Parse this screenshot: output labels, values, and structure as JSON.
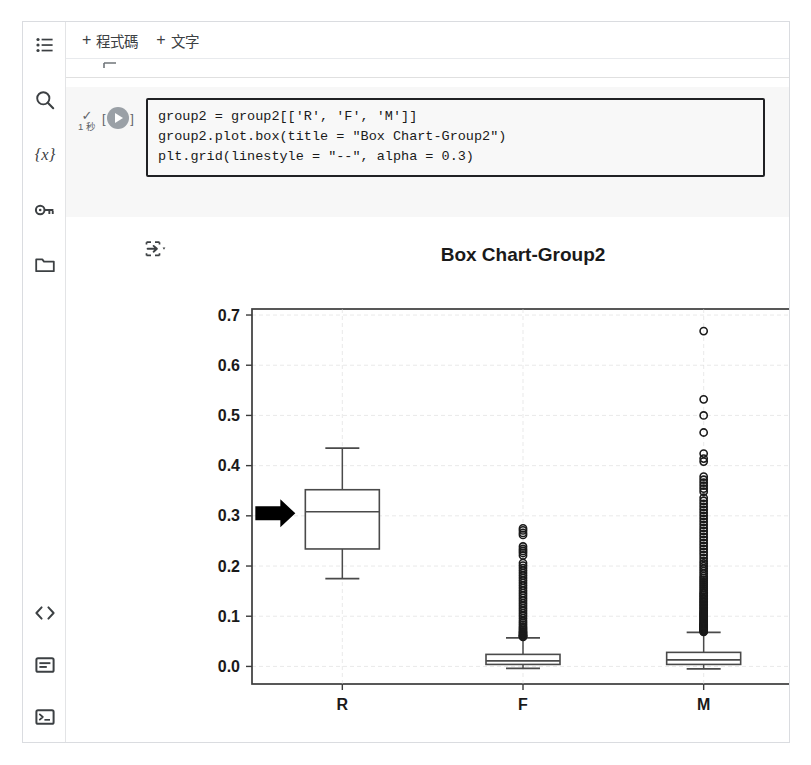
{
  "app": {
    "toolbar": {
      "add_code_label": "程式碼",
      "add_text_label": "文字",
      "plus": "+"
    },
    "sidebar": {
      "top_items": [
        {
          "name": "table-of-contents-icon",
          "label": "目錄"
        },
        {
          "name": "search-icon",
          "label": "搜尋"
        },
        {
          "name": "variables-icon",
          "label": "{x}"
        },
        {
          "name": "secrets-key-icon",
          "label": "密鑰"
        },
        {
          "name": "files-folder-icon",
          "label": "檔案"
        }
      ],
      "bottom_items": [
        {
          "name": "code-snippets-icon",
          "label": "< >"
        },
        {
          "name": "command-palette-icon",
          "label": "指令"
        },
        {
          "name": "terminal-icon",
          "label": "終端機"
        }
      ]
    },
    "cell": {
      "status_check": "✓",
      "run_time": "1 秒",
      "bracket_left": "[",
      "bracket_right": "]",
      "code_lines": [
        "group2 = group2[['R', 'F', 'M']]",
        "group2.plot.box(title = \"Box Chart-Group2\")",
        "plt.grid(linestyle = \"--\", alpha = 0.3)"
      ]
    },
    "colors": {
      "cell_background": "#f7f7f7",
      "editor_border": "#202124",
      "run_button": "#9aa0a6",
      "rail_icon": "#3c4043",
      "annotation_arrow": "#000000",
      "grid": "#d9d9d9",
      "axis": "#3b3b3b"
    }
  },
  "chart_data": {
    "type": "box",
    "title": "Box Chart-Group2",
    "xlabel": "",
    "ylabel": "",
    "categories": [
      "R",
      "F",
      "M"
    ],
    "ylim": [
      -0.035,
      0.712
    ],
    "yticks": [
      0.0,
      0.1,
      0.2,
      0.3,
      0.4,
      0.5,
      0.6,
      0.7
    ],
    "ytick_labels": [
      "0.0",
      "0.1",
      "0.2",
      "0.3",
      "0.4",
      "0.5",
      "0.6",
      "0.7"
    ],
    "grid": true,
    "grid_linestyle": "--",
    "grid_alpha": 0.3,
    "legend": "none",
    "boxes": [
      {
        "category": "R",
        "whisker_low": 0.175,
        "q1": 0.234,
        "median": 0.308,
        "q3": 0.352,
        "whisker_high": 0.435,
        "outliers": []
      },
      {
        "category": "F",
        "whisker_low": -0.004,
        "q1": 0.004,
        "median": 0.011,
        "q3": 0.024,
        "whisker_high": 0.057,
        "outliers": [
          0.275,
          0.271,
          0.266,
          0.262,
          0.239,
          0.234,
          0.23,
          0.226,
          0.221,
          0.206,
          0.201,
          0.196,
          0.191,
          0.186,
          0.181,
          0.176,
          0.171,
          0.166,
          0.161,
          0.156,
          0.151,
          0.146,
          0.141,
          0.136,
          0.131,
          0.126,
          0.121,
          0.116,
          0.111,
          0.106,
          0.101,
          0.096,
          0.091,
          0.087,
          0.083,
          0.079,
          0.076,
          0.073,
          0.07,
          0.068,
          0.066,
          0.064,
          0.062,
          0.061,
          0.06,
          0.059
        ]
      },
      {
        "category": "M",
        "whisker_low": -0.005,
        "q1": 0.004,
        "median": 0.013,
        "q3": 0.028,
        "whisker_high": 0.068,
        "outliers": [
          0.668,
          0.532,
          0.5,
          0.466,
          0.424,
          0.414,
          0.408,
          0.378,
          0.372,
          0.366,
          0.36,
          0.354,
          0.348,
          0.336,
          0.33,
          0.324,
          0.318,
          0.312,
          0.306,
          0.3,
          0.294,
          0.288,
          0.282,
          0.276,
          0.27,
          0.264,
          0.258,
          0.252,
          0.246,
          0.24,
          0.234,
          0.228,
          0.222,
          0.216,
          0.21,
          0.205,
          0.2,
          0.195,
          0.19,
          0.185,
          0.18,
          0.176,
          0.172,
          0.168,
          0.164,
          0.16,
          0.156,
          0.152,
          0.148,
          0.145,
          0.142,
          0.139,
          0.136,
          0.133,
          0.13,
          0.127,
          0.124,
          0.121,
          0.118,
          0.115,
          0.112,
          0.109,
          0.107,
          0.105,
          0.103,
          0.101,
          0.099,
          0.097,
          0.095,
          0.093,
          0.091,
          0.089,
          0.087,
          0.085,
          0.084,
          0.083,
          0.082,
          0.081,
          0.08,
          0.079,
          0.078,
          0.077,
          0.076,
          0.075,
          0.074,
          0.073,
          0.072,
          0.071,
          0.07,
          0.069
        ]
      }
    ],
    "annotations": [
      {
        "name": "arrow-pointer",
        "target_category": "R",
        "value": 0.305,
        "direction": "right"
      }
    ]
  }
}
